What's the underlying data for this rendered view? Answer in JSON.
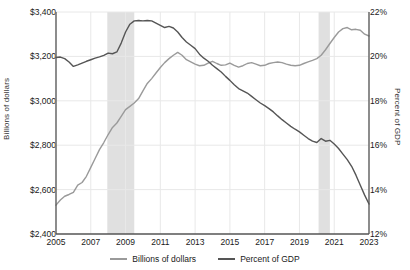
{
  "chart_data": {
    "type": "line",
    "title": "",
    "subtitle": "",
    "xlabel": "",
    "ylabel": "Billions of dollars",
    "y2label": "Percent of GDP",
    "grid": true,
    "legend_position": "bottom",
    "xlim": [
      2005,
      2023
    ],
    "xticks": [
      "2005",
      "2007",
      "2009",
      "2011",
      "2013",
      "2015",
      "2017",
      "2019",
      "2021",
      "2023"
    ],
    "xtick_values": [
      2005,
      2007,
      2009,
      2011,
      2013,
      2015,
      2017,
      2019,
      2021,
      2023
    ],
    "ylim": [
      2400,
      3400
    ],
    "yticks": [
      "$2,400",
      "$2,600",
      "$2,800",
      "$3,000",
      "$3,200",
      "$3,400"
    ],
    "ytick_values": [
      2400,
      2600,
      2800,
      3000,
      3200,
      3400
    ],
    "y2lim": [
      12,
      22
    ],
    "y2ticks": [
      "12%",
      "14%",
      "16%",
      "18%",
      "20%",
      "22%"
    ],
    "y2tick_values": [
      12,
      14,
      16,
      18,
      20,
      22
    ],
    "colors": {
      "billions": "#9a9a9a",
      "percent": "#555555",
      "recession_band": "#e0e0e0",
      "grid": "#e8e8e8",
      "axis": "#555555"
    },
    "shaded_regions": [
      {
        "label": "recession",
        "x_start": 2007.95,
        "x_end": 2009.5
      },
      {
        "label": "recession",
        "x_start": 2020.1,
        "x_end": 2020.75
      }
    ],
    "x": [
      2005.0,
      2005.25,
      2005.5,
      2005.75,
      2006.0,
      2006.25,
      2006.5,
      2006.75,
      2007.0,
      2007.25,
      2007.5,
      2007.75,
      2008.0,
      2008.25,
      2008.5,
      2008.75,
      2009.0,
      2009.25,
      2009.5,
      2009.75,
      2010.0,
      2010.25,
      2010.5,
      2010.75,
      2011.0,
      2011.25,
      2011.5,
      2011.75,
      2012.0,
      2012.25,
      2012.5,
      2012.75,
      2013.0,
      2013.25,
      2013.5,
      2013.75,
      2014.0,
      2014.25,
      2014.5,
      2014.75,
      2015.0,
      2015.25,
      2015.5,
      2015.75,
      2016.0,
      2016.25,
      2016.5,
      2016.75,
      2017.0,
      2017.25,
      2017.5,
      2017.75,
      2018.0,
      2018.25,
      2018.5,
      2018.75,
      2019.0,
      2019.25,
      2019.5,
      2019.75,
      2020.0,
      2020.25,
      2020.5,
      2020.75,
      2021.0,
      2021.25,
      2021.5,
      2021.75,
      2022.0,
      2022.25,
      2022.5,
      2022.75,
      2023.0
    ],
    "series": [
      {
        "name": "Billions of dollars",
        "axis": "left",
        "color": "#9a9a9a",
        "values": [
          2530,
          2553,
          2570,
          2578,
          2588,
          2620,
          2632,
          2660,
          2700,
          2740,
          2780,
          2812,
          2848,
          2880,
          2900,
          2930,
          2960,
          2975,
          2990,
          3010,
          3045,
          3078,
          3100,
          3125,
          3150,
          3172,
          3190,
          3205,
          3218,
          3205,
          3185,
          3175,
          3165,
          3158,
          3160,
          3170,
          3178,
          3168,
          3160,
          3162,
          3170,
          3160,
          3152,
          3158,
          3168,
          3172,
          3165,
          3158,
          3160,
          3168,
          3172,
          3175,
          3172,
          3165,
          3160,
          3158,
          3160,
          3168,
          3175,
          3182,
          3190,
          3205,
          3230,
          3258,
          3285,
          3310,
          3325,
          3330,
          3320,
          3322,
          3318,
          3300,
          3292
        ]
      },
      {
        "name": "Percent of GDP",
        "axis": "right",
        "color": "#555555",
        "values": [
          19.95,
          19.97,
          19.9,
          19.75,
          19.55,
          19.62,
          19.7,
          19.78,
          19.85,
          19.92,
          19.98,
          20.05,
          20.15,
          20.12,
          20.2,
          20.6,
          21.1,
          21.45,
          21.6,
          21.62,
          21.6,
          21.62,
          21.6,
          21.5,
          21.4,
          21.3,
          21.35,
          21.28,
          21.1,
          20.85,
          20.65,
          20.5,
          20.35,
          20.1,
          19.92,
          19.78,
          19.6,
          19.45,
          19.3,
          19.1,
          18.92,
          18.72,
          18.55,
          18.45,
          18.35,
          18.2,
          18.05,
          17.9,
          17.78,
          17.65,
          17.5,
          17.32,
          17.15,
          17.0,
          16.85,
          16.72,
          16.6,
          16.45,
          16.3,
          16.18,
          16.12,
          16.3,
          16.18,
          16.22,
          16.05,
          15.85,
          15.6,
          15.35,
          15.05,
          14.65,
          14.2,
          13.75,
          13.35
        ]
      }
    ]
  },
  "legend": {
    "items": [
      {
        "label": "Billions of dollars",
        "color": "#9a9a9a"
      },
      {
        "label": "Percent of GDP",
        "color": "#555555"
      }
    ]
  }
}
